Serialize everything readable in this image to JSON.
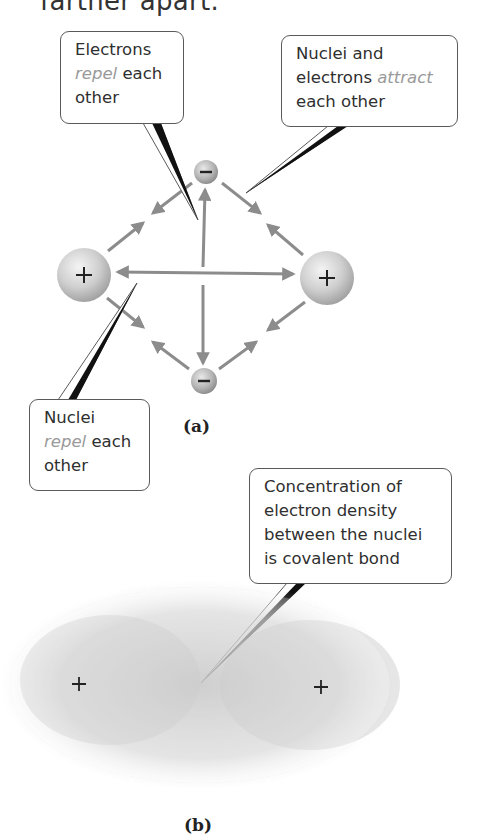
{
  "header": {
    "partial_text": "farther apart."
  },
  "panel_a": {
    "label": "(a)",
    "particles": [
      {
        "id": "nucleus-left",
        "type": "nucleus",
        "symbol": "+",
        "cx": 84,
        "cy": 275,
        "r": 27
      },
      {
        "id": "nucleus-right",
        "type": "nucleus",
        "symbol": "+",
        "cx": 327,
        "cy": 278,
        "r": 27
      },
      {
        "id": "electron-top",
        "type": "electron",
        "symbol": "−",
        "cx": 206,
        "cy": 172,
        "r": 12
      },
      {
        "id": "electron-bottom",
        "type": "electron",
        "symbol": "−",
        "cx": 204,
        "cy": 381,
        "r": 13
      }
    ],
    "callouts": {
      "electrons_repel": {
        "line1": "Electrons",
        "em": "repel",
        "rest": " each",
        "line3": "other"
      },
      "attract": {
        "line1": "Nuclei and",
        "line2a": "electrons ",
        "em": "attract",
        "line3": "each other"
      },
      "nuclei_repel": {
        "line1": "Nuclei",
        "em": "repel",
        "rest": " each",
        "line3": "other"
      }
    }
  },
  "panel_b": {
    "label": "(b)",
    "nuclei_symbols": [
      "+",
      "+"
    ],
    "callout": {
      "line1": "Concentration of",
      "line2": "electron density",
      "line3": "between the nuclei",
      "line4": "is covalent bond"
    }
  },
  "colors": {
    "arrow": "#8c8c8c",
    "callout_border": "#5a5a5a",
    "emphasis": "#9a9a9a",
    "cloud": "#b8b8b8"
  }
}
